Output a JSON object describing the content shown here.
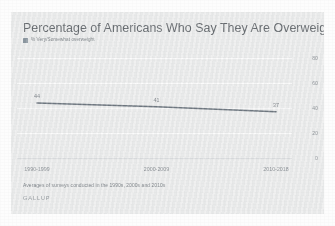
{
  "chart_data": {
    "type": "line",
    "title": "Percentage of Americans Who Say They Are Overweight",
    "xlabel": "",
    "ylabel": "",
    "categories": [
      "1990-1999",
      "2000-2009",
      "2010-2018"
    ],
    "series": [
      {
        "name": "% Very/Somewhat overweight",
        "values": [
          44,
          41,
          37
        ],
        "color": "#5c6670"
      }
    ],
    "point_labels": [
      "44",
      "41",
      "37"
    ],
    "ylim": [
      0,
      80
    ],
    "yticks": [
      "0",
      "20",
      "40",
      "60",
      "80"
    ],
    "ytick_values": [
      0,
      20,
      40,
      60,
      80
    ],
    "grid": true,
    "y_axis_position": "right",
    "legend": {
      "position": "top-left",
      "entries": [
        {
          "label": "% Very/Somewhat overweight",
          "swatch_color": "#7f8c96"
        }
      ]
    },
    "footnote": "Averages of surveys conducted in the 1990s, 2000s and 2010s",
    "source": "GALLUP",
    "colors": {
      "card_background": "#eceded",
      "page_background": "#fdfdfd",
      "gridline": "#fbfbfb",
      "axis_line": "#d8dadc",
      "title_text": "#53585d",
      "tick_text": "#7c8288",
      "line": "#5c6670"
    }
  }
}
